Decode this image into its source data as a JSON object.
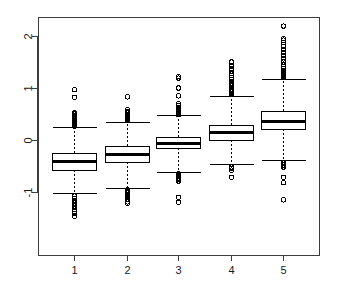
{
  "chart_data": {
    "type": "box",
    "title": "",
    "xlabel": "",
    "ylabel": "",
    "categories": [
      "1",
      "2",
      "3",
      "4",
      "5"
    ],
    "xtick_labels": [
      "1",
      "2",
      "3",
      "4",
      "5"
    ],
    "ytick_labels": [
      "-1",
      "0",
      "1",
      "2"
    ],
    "ytick_values": [
      -1,
      0,
      1,
      2
    ],
    "ylim": [
      -1.55,
      2.35
    ],
    "xlim": [
      0.4,
      5.6
    ],
    "grid": false,
    "legend": null,
    "box_fill": "#ffffff",
    "box_stroke": "#000000",
    "median_color": "#000000",
    "whisker_style": "dashed",
    "outlier_marker": "circle",
    "frame": true,
    "series": [
      {
        "name": "1",
        "x": 1,
        "lower_whisker": -1.02,
        "q1": -0.57,
        "median": -0.4,
        "q3": -0.245,
        "upper_whisker": 0.245,
        "outliers_upper": [
          0.97,
          0.82,
          0.52,
          0.5,
          0.47,
          0.45,
          0.43,
          0.41,
          0.39,
          0.37,
          0.35,
          0.33,
          0.31,
          0.29,
          0.27
        ],
        "outliers_lower": [
          -1.08,
          -1.12,
          -1.16,
          -1.18,
          -1.21,
          -1.24,
          -1.27,
          -1.3,
          -1.33,
          -1.37,
          -1.41,
          -1.47
        ]
      },
      {
        "name": "2",
        "x": 2,
        "lower_whisker": -0.92,
        "q1": -0.42,
        "median": -0.27,
        "q3": -0.12,
        "upper_whisker": 0.355,
        "outliers_upper": [
          0.83,
          0.58,
          0.55,
          0.52,
          0.49,
          0.47,
          0.45,
          0.43,
          0.41,
          0.39,
          0.37
        ],
        "outliers_lower": [
          -0.96,
          -0.99,
          -1.02,
          -1.05,
          -1.09,
          -1.14,
          -1.19,
          -1.22
        ]
      },
      {
        "name": "3",
        "x": 3,
        "lower_whisker": -0.62,
        "q1": -0.155,
        "median": -0.06,
        "q3": 0.06,
        "upper_whisker": 0.48,
        "outliers_upper": [
          1.22,
          1.19,
          1.0,
          0.85,
          0.7,
          0.66,
          0.63,
          0.61,
          0.59,
          0.57,
          0.55,
          0.53,
          0.51,
          0.49
        ],
        "outliers_lower": [
          -0.65,
          -0.68,
          -0.7,
          -0.73,
          -0.76,
          -0.79,
          -1.1,
          -1.2
        ]
      },
      {
        "name": "4",
        "x": 4,
        "lower_whisker": -0.47,
        "q1": 0.005,
        "median": 0.145,
        "q3": 0.29,
        "upper_whisker": 0.855,
        "outliers_upper": [
          1.5,
          1.43,
          1.38,
          1.33,
          1.28,
          1.24,
          1.2,
          1.16,
          1.13,
          1.1,
          1.07,
          1.04,
          1.01,
          0.98,
          0.96,
          0.94,
          0.92,
          0.9,
          0.88,
          0.87
        ],
        "outliers_lower": [
          -0.52,
          -0.55,
          -0.58,
          -0.72
        ]
      },
      {
        "name": "5",
        "x": 5,
        "lower_whisker": -0.38,
        "q1": 0.21,
        "median": 0.36,
        "q3": 0.565,
        "upper_whisker": 1.18,
        "outliers_upper": [
          2.19,
          1.95,
          1.92,
          1.88,
          1.8,
          1.74,
          1.68,
          1.62,
          1.56,
          1.5,
          1.45,
          1.41,
          1.37,
          1.34,
          1.31,
          1.28,
          1.26,
          1.24,
          1.22,
          1.2
        ],
        "outliers_lower": [
          -0.44,
          -0.48,
          -0.52,
          -0.72,
          -0.82,
          -1.15
        ]
      }
    ]
  }
}
